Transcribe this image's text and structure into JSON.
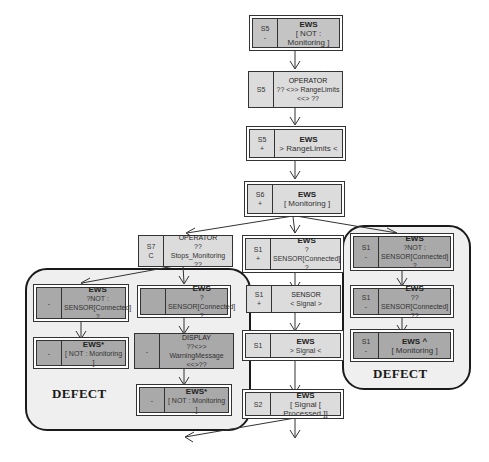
{
  "diagram": {
    "colors": {
      "node_light": "#dcdcdc",
      "node_mid": "#c4c4c4",
      "node_dark": "#a9a9a9",
      "panel_bg": "#efefef",
      "line": "#333333"
    },
    "panels": {
      "left_label": "DEFECT",
      "right_label": "DEFECT"
    },
    "main_chain": [
      {
        "state": "S5",
        "sign": "-",
        "agent": "EWS",
        "prop": "[ NOT : Monitoring ]"
      },
      {
        "state": "S5",
        "sign": "",
        "agent": "OPERATOR",
        "prop": "?? <>> RangeLimits <<> ??"
      },
      {
        "state": "S5",
        "sign": "+",
        "agent": "EWS",
        "prop": "> RangeLimits <"
      },
      {
        "state": "S6",
        "sign": "+",
        "agent": "EWS",
        "prop": "[ Monitoring ]"
      }
    ],
    "operator_branch": {
      "state": "S7",
      "sign": "C",
      "agent": "OPERATOR",
      "prop": "?? Stops_Monitoring ??"
    },
    "center_branch": [
      {
        "state": "S1",
        "sign": "+",
        "agent": "EWS",
        "prop": "? SENSOR[Connected] ?"
      },
      {
        "state": "S1",
        "sign": "+",
        "agent": "SENSOR",
        "prop": "< Signal >"
      },
      {
        "state": "S1",
        "sign": "",
        "agent": "EWS",
        "prop": "> Signal <"
      },
      {
        "state": "S2",
        "sign": "",
        "agent": "EWS",
        "prop": "[ Signal [ Processed ]]"
      }
    ],
    "left_defect": {
      "col1": [
        {
          "state": "",
          "sign": "-",
          "agent": "EWS",
          "prop": "?NOT : SENSOR[Connected] ?"
        },
        {
          "state": "",
          "sign": "-",
          "agent": "EWS*",
          "prop": "[ NOT : Monitoring ]"
        }
      ],
      "col2": [
        {
          "state": "",
          "sign": "",
          "agent": "EWS",
          "prop": "? SENSOR[Connected] ?"
        },
        {
          "state": "",
          "sign": "-",
          "agent": "DISPLAY",
          "prop": "??<>> WarningMessage <<>??"
        },
        {
          "state": "",
          "sign": "-",
          "agent": "EWS*",
          "prop": "[ NOT : Monitoring ]"
        }
      ]
    },
    "right_defect": [
      {
        "state": "S1",
        "sign": "-",
        "agent": "EWS",
        "prop": "?NOT : SENSOR[Connected] ?"
      },
      {
        "state": "S1",
        "sign": "-",
        "agent": "EWS",
        "prop": "?? SENSOR[Connected] ??"
      },
      {
        "state": "S1",
        "sign": "-",
        "agent": "EWS ^",
        "prop": "[ Monitoring ]"
      }
    ]
  }
}
